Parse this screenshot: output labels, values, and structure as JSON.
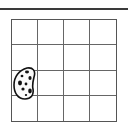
{
  "board": {
    "rows": 4,
    "cols": 4,
    "line_color": "#555555",
    "background": "#ffffff"
  },
  "pieces": [
    {
      "name": "cookie-bean-piece",
      "row": 2,
      "col": 0,
      "span_rows": 2,
      "color": "#111111"
    }
  ]
}
